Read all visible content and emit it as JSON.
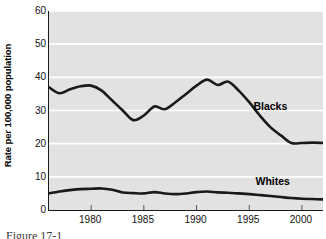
{
  "chart_data": {
    "type": "line",
    "title": "",
    "xlabel": "",
    "ylabel": "Rate per 100,000 population",
    "xlim": [
      1976,
      2002
    ],
    "ylim": [
      0,
      60
    ],
    "grid": "horizontal-white",
    "legend_position": "inline-right",
    "x_ticks": [
      1980,
      1985,
      1990,
      1995,
      2000
    ],
    "y_ticks": [
      0,
      10,
      20,
      30,
      40,
      50,
      60
    ],
    "x": [
      1976,
      1977,
      1978,
      1979,
      1980,
      1981,
      1982,
      1983,
      1984,
      1985,
      1986,
      1987,
      1988,
      1989,
      1990,
      1991,
      1992,
      1993,
      1994,
      1995,
      1996,
      1997,
      1998,
      1999,
      2000,
      2001,
      2002
    ],
    "series": [
      {
        "name": "Blacks",
        "color": "#1a1a1a",
        "values": [
          37.0,
          35.2,
          36.4,
          37.3,
          37.5,
          36.0,
          33.0,
          30.0,
          27.1,
          28.5,
          31.2,
          30.4,
          32.5,
          35.0,
          37.5,
          39.3,
          37.7,
          38.7,
          36.0,
          32.5,
          28.5,
          25.0,
          22.5,
          20.2,
          20.2,
          20.3,
          20.2
        ]
      },
      {
        "name": "Whites",
        "color": "#1a1a1a",
        "values": [
          5.0,
          5.6,
          6.0,
          6.3,
          6.4,
          6.5,
          6.1,
          5.3,
          5.1,
          5.0,
          5.4,
          5.0,
          4.8,
          5.0,
          5.4,
          5.6,
          5.3,
          5.2,
          5.0,
          4.8,
          4.5,
          4.2,
          3.9,
          3.6,
          3.4,
          3.3,
          3.2
        ]
      }
    ],
    "annotations": [
      {
        "text": "Blacks",
        "x": 1995.4,
        "y": 31.5
      },
      {
        "text": "Whites",
        "x": 1995.6,
        "y": 8.6
      }
    ]
  },
  "caption": {
    "text": "Figure  17-1"
  }
}
